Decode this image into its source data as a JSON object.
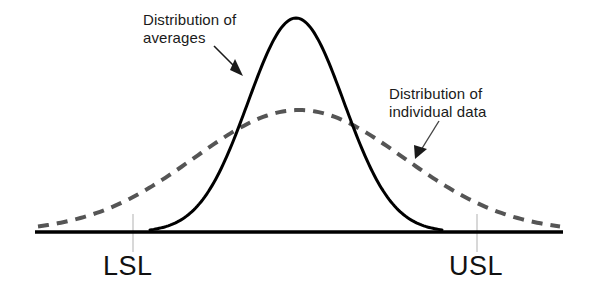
{
  "figure": {
    "background_color": "#ffffff",
    "width": 591,
    "height": 296
  },
  "annotations": {
    "averages": {
      "line1": "Distribution of",
      "line2": "averages"
    },
    "individual": {
      "line1": "Distribution of",
      "line2": "individual data"
    }
  },
  "spec_limits": {
    "lower_label": "LSL",
    "upper_label": "USL",
    "lower_x": 133,
    "upper_x": 477,
    "tick_color": "#d8d8d8"
  },
  "colors": {
    "axis": "#000000",
    "solid_curve": "#000000",
    "dashed_curve": "#555555",
    "arrow": "#1a1a1a",
    "text": "#111111"
  },
  "chart_data": {
    "type": "line",
    "xlabel": "",
    "ylabel": "",
    "grid": false,
    "legend_position": "inline-annotations",
    "axis_baseline_y": 232,
    "axis_x_start": 35,
    "axis_x_end": 563,
    "series": [
      {
        "name": "Distribution of averages",
        "style": "solid",
        "color": "#000000",
        "linewidth": 3,
        "mean_x": 296,
        "sigma_x": 48,
        "peak_y": 18,
        "baseline_y": 232,
        "x_domain": [
          150,
          442
        ]
      },
      {
        "name": "Distribution of individual data",
        "style": "dashed",
        "color": "#555555",
        "linewidth": 4,
        "dash_pattern": [
          11,
          8
        ],
        "mean_x": 299,
        "sigma_x": 105,
        "peak_y": 110,
        "baseline_y": 232,
        "x_domain": [
          38,
          560
        ]
      }
    ],
    "markers": [
      {
        "label": "LSL",
        "x": 133,
        "type": "spec-limit"
      },
      {
        "label": "USL",
        "x": 477,
        "type": "spec-limit"
      }
    ],
    "arrows": [
      {
        "label": "Distribution of averages",
        "from": [
          214,
          46
        ],
        "to": [
          241,
          73
        ]
      },
      {
        "label": "Distribution of individual data",
        "from": [
          439,
          121
        ],
        "to": [
          417,
          156
        ]
      }
    ]
  }
}
